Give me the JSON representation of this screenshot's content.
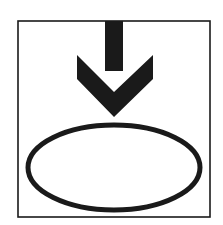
{
  "symbol": {
    "name": "arrow-into-ellipse",
    "description": "Downward arrow pointing into an ellipse inside a square frame",
    "colors": {
      "background": "#ffffff",
      "stroke": "#1a1a1a",
      "fill": "#1a1a1a"
    },
    "frame": {
      "x": 18,
      "y": 21,
      "width": 192,
      "height": 196,
      "stroke_width": 1.6
    },
    "arrow": {
      "stem": {
        "x": 105,
        "y": 21,
        "width": 18,
        "height": 45
      },
      "head_points": "77,55 105,80 105,55 123,55 123,80 153,55 153,79 114,117 77,79"
    },
    "ellipse": {
      "cx": 114,
      "cy": 167.5,
      "rx": 86,
      "ry": 42.5,
      "stroke_width": 5
    }
  }
}
